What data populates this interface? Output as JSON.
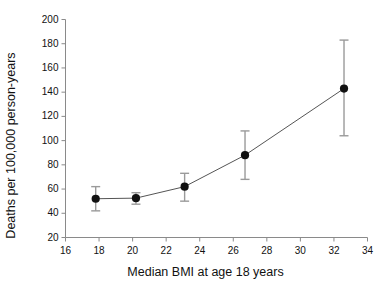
{
  "chart_data": {
    "type": "scatter",
    "title": "",
    "xlabel": "Median BMI at age 18 years",
    "ylabel": "Deaths per 100,000 person-years",
    "xlim": [
      16,
      34
    ],
    "ylim": [
      20,
      200
    ],
    "xticks": [
      16,
      18,
      20,
      22,
      24,
      26,
      28,
      30,
      32,
      34
    ],
    "yticks": [
      20,
      40,
      60,
      80,
      100,
      120,
      140,
      160,
      180,
      200
    ],
    "grid": false,
    "legend": "none",
    "marker": "filled-circle",
    "line_style": "solid",
    "error_bars": "vertical 95% CI",
    "series": [
      {
        "name": "Mortality rate by median BMI at age 18",
        "x": [
          17.8,
          20.2,
          23.1,
          26.7,
          32.6
        ],
        "values": [
          52,
          52.5,
          62,
          88,
          143
        ],
        "y_low": [
          42,
          47.5,
          50,
          68,
          104
        ],
        "y_high": [
          62,
          57,
          73,
          108,
          183
        ]
      }
    ]
  },
  "axes": {
    "x_tick_labels": [
      "16",
      "18",
      "20",
      "22",
      "24",
      "26",
      "28",
      "30",
      "32",
      "34"
    ],
    "y_tick_labels": [
      "20",
      "40",
      "60",
      "80",
      "100",
      "120",
      "140",
      "160",
      "180",
      "200"
    ]
  },
  "colors": {
    "axis": "#8a8a8a",
    "marker": "#111111",
    "line": "#555555",
    "errorbar": "#9a9a9a",
    "text": "#111111",
    "background": "#ffffff"
  }
}
